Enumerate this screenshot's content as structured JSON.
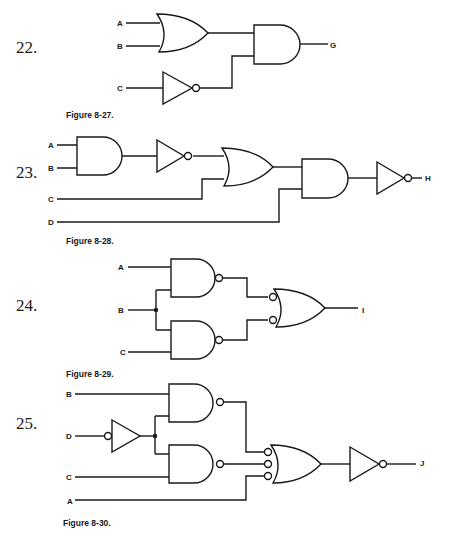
{
  "problems": [
    {
      "number": "22.",
      "caption": "Figure 8-27.",
      "inputs": [
        "A",
        "B",
        "C"
      ],
      "output": "G",
      "gates": [
        "OR(A,B)",
        "NOT(C)",
        "AND(OR, NOT)"
      ],
      "expression": "G = (A + B) · C'"
    },
    {
      "number": "23.",
      "caption": "Figure 8-28.",
      "inputs": [
        "A",
        "B",
        "C",
        "D"
      ],
      "output": "H",
      "gates": [
        "AND(A,B)",
        "NOT",
        "OR(NOT, C)",
        "AND(OR, D)",
        "NOT"
      ],
      "expression": "H = (((AB)' + C) · D)'"
    },
    {
      "number": "24.",
      "caption": "Figure 8-29.",
      "inputs": [
        "A",
        "B",
        "C"
      ],
      "output": "I",
      "gates": [
        "NAND(A,B)",
        "NAND(B,C)",
        "OR with inverted inputs"
      ],
      "expression": "I = AB + BC"
    },
    {
      "number": "25.",
      "caption": "Figure 8-30.",
      "inputs": [
        "B",
        "D",
        "C",
        "A"
      ],
      "output": "J",
      "gates": [
        "NOT(D) with input bubble",
        "NAND(B, D)",
        "NAND(D, C)",
        "OR with 3 inverted inputs",
        "NOT"
      ],
      "expression": "J = (BD + DC + A')'"
    }
  ]
}
